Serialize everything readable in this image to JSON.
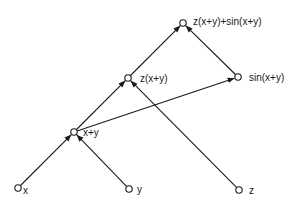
{
  "diagram": {
    "type": "computation-graph",
    "colors": {
      "stroke": "#1a1a1a",
      "node_fill": "#ffffff",
      "background": "#ffffff"
    },
    "nodes": [
      {
        "id": "x",
        "label": "x",
        "cx": 18,
        "cy": 188,
        "lx": 23,
        "ly": 186
      },
      {
        "id": "y",
        "label": "y",
        "cx": 129,
        "cy": 189,
        "lx": 137,
        "ly": 185
      },
      {
        "id": "z",
        "label": "z",
        "cx": 239,
        "cy": 190,
        "lx": 249,
        "ly": 186
      },
      {
        "id": "xpy",
        "label": "x+y",
        "cx": 74,
        "cy": 132,
        "lx": 83,
        "ly": 128
      },
      {
        "id": "zxy",
        "label": "z(x+y)",
        "cx": 128,
        "cy": 78,
        "lx": 140,
        "ly": 74
      },
      {
        "id": "sinxy",
        "label": "sin(x+y)",
        "cx": 238,
        "cy": 77,
        "lx": 249,
        "ly": 73
      },
      {
        "id": "out",
        "label": "z(x+y)+sin(x+y)",
        "cx": 183,
        "cy": 23,
        "lx": 193,
        "ly": 17
      }
    ],
    "edges": [
      {
        "from": "x",
        "to": "xpy"
      },
      {
        "from": "y",
        "to": "xpy"
      },
      {
        "from": "xpy",
        "to": "zxy"
      },
      {
        "from": "z",
        "to": "zxy"
      },
      {
        "from": "xpy",
        "to": "sinxy"
      },
      {
        "from": "zxy",
        "to": "out"
      },
      {
        "from": "sinxy",
        "to": "out"
      }
    ]
  }
}
